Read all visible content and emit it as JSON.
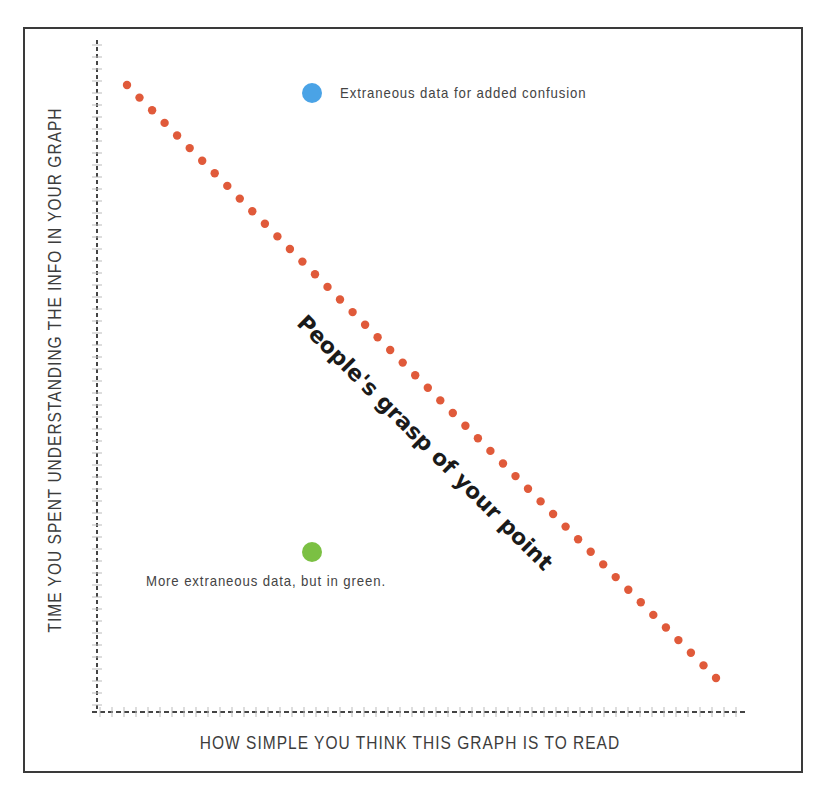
{
  "chart_data": {
    "type": "scatter",
    "title": "",
    "xlabel": "HOW SIMPLE YOU THINK THIS GRAPH IS TO READ",
    "ylabel": "TIME YOU SPENT UNDERSTANDING THE INFO IN YOUR GRAPH",
    "xlim": [
      0,
      100
    ],
    "ylim": [
      0,
      100
    ],
    "grid": false,
    "legend": "none",
    "series": [
      {
        "name": "People's grasp of your point",
        "style": "dotted-line",
        "color": "#e05a3a",
        "start": {
          "x": 5,
          "y": 96
        },
        "end": {
          "x": 96,
          "y": 5
        },
        "dot_count": 48
      },
      {
        "name": "Extraneous data for added confusion",
        "style": "point",
        "color": "#4aa3e6",
        "x": 33,
        "y": 96
      },
      {
        "name": "More extraneous data, but in green.",
        "style": "point",
        "color": "#7bc043",
        "x": 33,
        "y": 27
      }
    ],
    "annotations": [
      {
        "text": "People's grasp of your point",
        "rotation_deg": 45
      },
      {
        "text": "Extraneous data for added confusion"
      },
      {
        "text": "More extraneous data, but in green."
      }
    ]
  },
  "labels": {
    "x_axis": "HOW SIMPLE YOU THINK THIS GRAPH IS TO READ",
    "y_axis": "TIME YOU SPENT UNDERSTANDING THE INFO IN YOUR GRAPH",
    "diagonal": "People's grasp of your point",
    "blue_point": "Extraneous data for added confusion",
    "green_point": "More extraneous data, but in green."
  },
  "colors": {
    "line_dots": "#e05a3a",
    "blue_point": "#4aa3e6",
    "green_point": "#7bc043",
    "frame": "#3a3a3a",
    "axis": "#444444"
  }
}
